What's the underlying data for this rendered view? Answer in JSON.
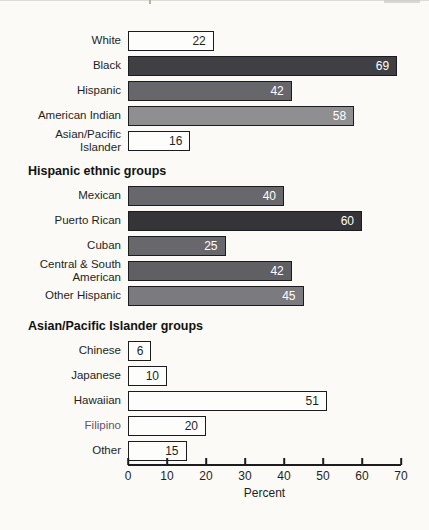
{
  "page": {
    "background": "#fbfaf7",
    "ink_color": "#1c1c1e"
  },
  "chart_data": {
    "type": "bar",
    "orientation": "horizontal",
    "xlabel": "Percent",
    "xlim": [
      0,
      70
    ],
    "grid": false,
    "legend": false,
    "sections": [
      {
        "title": "",
        "rows": [
          {
            "label": "White",
            "value": 22,
            "fill": "#fdfdfb",
            "value_color": "#1f1f1f"
          },
          {
            "label": "Black",
            "value": 69,
            "fill": "#403f44",
            "value_color": "#ffffff"
          },
          {
            "label": "Hispanic",
            "value": 42,
            "fill": "#67666b",
            "value_color": "#ffffff"
          },
          {
            "label": "American Indian",
            "value": 58,
            "fill": "#8f8e91",
            "value_color": "#ffffff"
          },
          {
            "label": "Asian/Pacific\nIslander",
            "value": 16,
            "fill": "#fdfdfb",
            "value_color": "#1f1f1f"
          }
        ]
      },
      {
        "title": "Hispanic ethnic groups",
        "rows": [
          {
            "label": "Mexican",
            "value": 40,
            "fill": "#68676c",
            "value_color": "#ffffff"
          },
          {
            "label": "Puerto Rican",
            "value": 60,
            "fill": "#353439",
            "value_color": "#ffffff"
          },
          {
            "label": "Cuban",
            "value": 25,
            "fill": "#68676c",
            "value_color": "#ffffff"
          },
          {
            "label": "Central & South\nAmerican",
            "value": 42,
            "fill": "#605f64",
            "value_color": "#ffffff"
          },
          {
            "label": "Other Hispanic",
            "value": 45,
            "fill": "#7b7a7e",
            "value_color": "#ffffff"
          }
        ]
      },
      {
        "title": "Asian/Pacific Islander groups",
        "rows": [
          {
            "label": "Chinese",
            "value": 6,
            "fill": "#fdfdfb",
            "value_color": "#1f1f1f"
          },
          {
            "label": "Japanese",
            "value": 10,
            "fill": "#fdfdfb",
            "value_color": "#1f1f1f"
          },
          {
            "label": "Hawaiian",
            "value": 51,
            "fill": "#fdfdfb",
            "value_color": "#1f1f1f"
          },
          {
            "label": "Filipino",
            "value": 20,
            "fill": "#fdfdfb",
            "value_color": "#1f1f1f",
            "label_color": "#6b4f70"
          },
          {
            "label": "Other",
            "value": 15,
            "fill": "#fdfdfb",
            "value_color": "#1f1f1f"
          }
        ]
      }
    ],
    "axis": {
      "ticks": [
        "0",
        "10",
        "20",
        "30",
        "40",
        "50",
        "60",
        "70"
      ],
      "label": "Percent"
    }
  }
}
